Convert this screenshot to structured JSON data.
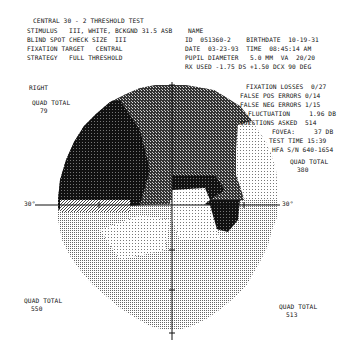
{
  "header": {
    "title": "CENTRAL 30 - 2 THRESHOLD TEST",
    "left_lines": [
      "STIMULUS   III, WHITE, BCKGND 31.5 ASB",
      "BLIND SPOT CHECK SIZE  III",
      "FIXATION TARGET   CENTRAL",
      "STRATEGY   FULL THRESHOLD"
    ],
    "name_label": "NAME",
    "right_lines": [
      "ID  051360-2    BIRTHDATE  10-19-31",
      "DATE  03-23-93  TIME  08:45:14 AM",
      "PUPIL DIAMETER   5.0 MM  VA  20/20",
      "RX USED -1.75 DS +1.50 DCX 90 DEG"
    ]
  },
  "reliability": {
    "fixation_losses": "FIXATION LOSSES  0/27",
    "false_pos": "FALSE POS ERRORS 0/14",
    "false_neg": "FALSE NEG ERRORS 1/15",
    "fluctuation": "FLUCTUATION     1.96 DB",
    "questions": "QUESTIONS ASKED  514",
    "fovea": "FOVEA:     37 DB",
    "test_time": "TEST TIME 15:39",
    "serial": "HFA S/N 640-1654"
  },
  "plot": {
    "eye": "RIGHT",
    "axis_label_left": "30°",
    "axis_label_right": "30°",
    "quadrants": [
      {
        "label": "QUAD TOTAL",
        "value": "79",
        "position": "upper-left"
      },
      {
        "label": "QUAD TOTAL",
        "value": "380",
        "position": "upper-right"
      },
      {
        "label": "QUAD TOTAL",
        "value": "550",
        "position": "lower-left"
      },
      {
        "label": "QUAD TOTAL",
        "value": "513",
        "position": "lower-right"
      }
    ],
    "colors": {
      "dark": "#111111",
      "mid": "#555555",
      "light": "#9a9a9a",
      "faint": "#c8c8c8"
    }
  }
}
